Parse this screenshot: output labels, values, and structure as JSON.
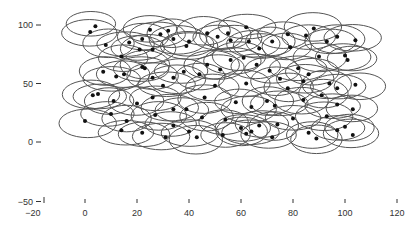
{
  "chart_data": {
    "type": "scatter",
    "title": "",
    "xlabel": "",
    "ylabel": "",
    "xlim": [
      -20,
      120
    ],
    "ylim": [
      -50,
      100
    ],
    "x_ticks": [
      -20,
      0,
      20,
      40,
      60,
      80,
      100,
      120
    ],
    "y_ticks": [
      -50,
      0,
      50,
      100
    ],
    "grid": false,
    "legend": null,
    "marker_ellipse": {
      "width_units": 20,
      "height_units": 20,
      "stroke": "#555555"
    },
    "dot_color": "#111111",
    "points": [
      [
        4,
        99
      ],
      [
        2,
        94
      ],
      [
        8,
        83
      ],
      [
        17,
        85
      ],
      [
        25,
        96
      ],
      [
        32,
        95
      ],
      [
        29,
        92
      ],
      [
        22,
        88
      ],
      [
        34,
        88
      ],
      [
        21,
        79
      ],
      [
        14,
        73
      ],
      [
        26,
        79
      ],
      [
        40,
        86
      ],
      [
        39,
        82
      ],
      [
        47,
        93
      ],
      [
        51,
        90
      ],
      [
        56,
        87
      ],
      [
        55,
        93
      ],
      [
        62,
        98
      ],
      [
        63,
        86
      ],
      [
        72,
        86
      ],
      [
        67,
        80
      ],
      [
        78,
        92
      ],
      [
        88,
        97
      ],
      [
        85,
        91
      ],
      [
        79,
        81
      ],
      [
        97,
        90
      ],
      [
        93,
        86
      ],
      [
        104,
        87
      ],
      [
        90,
        73
      ],
      [
        101,
        70
      ],
      [
        100,
        74
      ],
      [
        7,
        60
      ],
      [
        12,
        56
      ],
      [
        15,
        58
      ],
      [
        22,
        64
      ],
      [
        23,
        63
      ],
      [
        26,
        55
      ],
      [
        34,
        55
      ],
      [
        38,
        60
      ],
      [
        44,
        58
      ],
      [
        47,
        66
      ],
      [
        52,
        62
      ],
      [
        56,
        70
      ],
      [
        61,
        72
      ],
      [
        66,
        66
      ],
      [
        71,
        61
      ],
      [
        75,
        54
      ],
      [
        82,
        63
      ],
      [
        86,
        58
      ],
      [
        94,
        50
      ],
      [
        97,
        46
      ],
      [
        104,
        49
      ],
      [
        3,
        40
      ],
      [
        5,
        41
      ],
      [
        11,
        35
      ],
      [
        20,
        33
      ],
      [
        26,
        38
      ],
      [
        34,
        28
      ],
      [
        46,
        38
      ],
      [
        58,
        34
      ],
      [
        64,
        30
      ],
      [
        70,
        35
      ],
      [
        73,
        31
      ],
      [
        84,
        36
      ],
      [
        91,
        40
      ],
      [
        97,
        32
      ],
      [
        103,
        28
      ],
      [
        0,
        18
      ],
      [
        10,
        24
      ],
      [
        16,
        18
      ],
      [
        27,
        23
      ],
      [
        34,
        14
      ],
      [
        40,
        9
      ],
      [
        45,
        21
      ],
      [
        54,
        19
      ],
      [
        60,
        12
      ],
      [
        62,
        7
      ],
      [
        64,
        9
      ],
      [
        67,
        14
      ],
      [
        74,
        15
      ],
      [
        80,
        20
      ],
      [
        86,
        8
      ],
      [
        93,
        22
      ],
      [
        97,
        10
      ],
      [
        100,
        13
      ],
      [
        103,
        6
      ],
      [
        22,
        8
      ],
      [
        31,
        4
      ],
      [
        43,
        4
      ],
      [
        53,
        6
      ],
      [
        72,
        4
      ],
      [
        89,
        3
      ],
      [
        30,
        48
      ],
      [
        50,
        48
      ],
      [
        78,
        46
      ],
      [
        14,
        10
      ],
      [
        62,
        50
      ],
      [
        84,
        52
      ],
      [
        39,
        28
      ]
    ]
  }
}
